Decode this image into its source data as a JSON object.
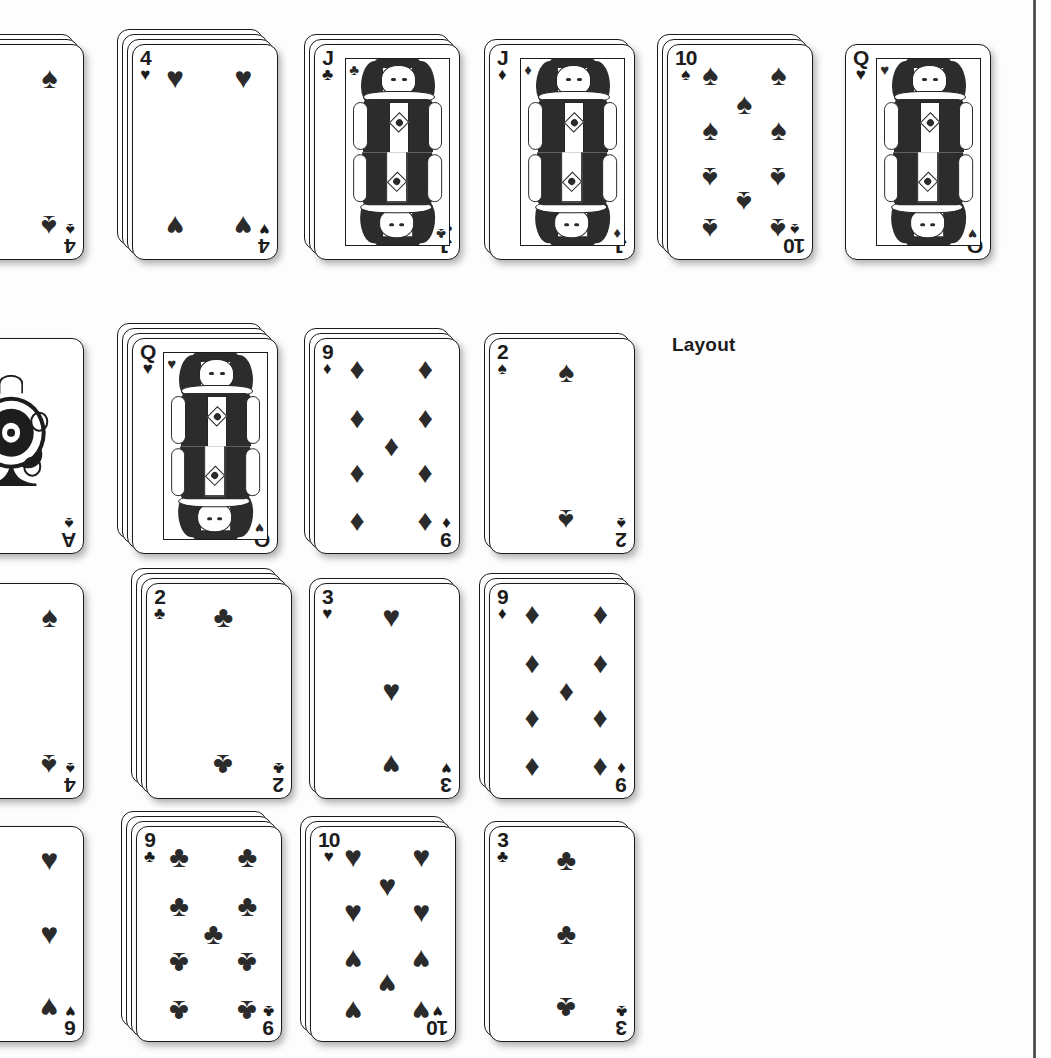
{
  "page": {
    "caption": "Layout",
    "caption_x": 672,
    "caption_y": 334,
    "background": "#fdfdfd",
    "rule_color": "#3a3a3a"
  },
  "suits": {
    "spade": "♠",
    "heart": "♥",
    "diamond": "♦",
    "club": "♣"
  },
  "card_size": {
    "w": 146,
    "h": 216
  },
  "tableau": {
    "rows": [
      {
        "row": 1,
        "y": 44,
        "cards": [
          {
            "rank": "4",
            "suit": "spade",
            "stack": 3,
            "x": -62,
            "art": "pips",
            "clipped": true
          },
          {
            "rank": "4",
            "suit": "heart",
            "stack": 4,
            "x": 132,
            "art": "pips",
            "clipped": false
          },
          {
            "rank": "J",
            "suit": "club",
            "stack": 3,
            "x": 314,
            "art": "court",
            "clipped": false
          },
          {
            "rank": "J",
            "suit": "diamond",
            "stack": 2,
            "x": 489,
            "art": "court",
            "clipped": false
          },
          {
            "rank": "10",
            "suit": "spade",
            "stack": 3,
            "x": 667,
            "art": "pips",
            "clipped": false
          },
          {
            "rank": "Q",
            "suit": "heart",
            "stack": 1,
            "x": 845,
            "art": "court",
            "clipped": false
          }
        ]
      },
      {
        "row": 2,
        "y": 338,
        "cards": [
          {
            "rank": "A",
            "suit": "spade",
            "stack": 1,
            "x": -62,
            "art": "ace",
            "clipped": true
          },
          {
            "rank": "Q",
            "suit": "heart",
            "stack": 4,
            "x": 132,
            "art": "court",
            "clipped": false
          },
          {
            "rank": "9",
            "suit": "diamond",
            "stack": 3,
            "x": 314,
            "art": "pips",
            "clipped": false
          },
          {
            "rank": "2",
            "suit": "spade",
            "stack": 2,
            "x": 489,
            "art": "pips",
            "clipped": false
          }
        ]
      },
      {
        "row": 3,
        "y": 583,
        "cards": [
          {
            "rank": "4",
            "suit": "spade",
            "stack": 1,
            "x": -62,
            "art": "pips",
            "clipped": true
          },
          {
            "rank": "2",
            "suit": "club",
            "stack": 4,
            "x": 146,
            "art": "pips",
            "clipped": false
          },
          {
            "rank": "3",
            "suit": "heart",
            "stack": 2,
            "x": 314,
            "art": "pips",
            "clipped": false
          },
          {
            "rank": "9",
            "suit": "diamond",
            "stack": 3,
            "x": 489,
            "art": "pips",
            "clipped": false
          }
        ]
      },
      {
        "row": 4,
        "y": 826,
        "cards": [
          {
            "rank": "6",
            "suit": "heart",
            "stack": 1,
            "x": -62,
            "art": "pips",
            "clipped": true
          },
          {
            "rank": "9",
            "suit": "club",
            "stack": 4,
            "x": 136,
            "art": "pips",
            "clipped": false
          },
          {
            "rank": "10",
            "suit": "heart",
            "stack": 3,
            "x": 310,
            "art": "pips",
            "clipped": false
          },
          {
            "rank": "3",
            "suit": "club",
            "stack": 2,
            "x": 489,
            "art": "pips",
            "clipped": false
          }
        ]
      }
    ]
  },
  "pip_layouts": {
    "2": [
      [
        50,
        10,
        0
      ],
      [
        50,
        90,
        1
      ]
    ],
    "3": [
      [
        50,
        10,
        0
      ],
      [
        50,
        50,
        0
      ],
      [
        50,
        90,
        1
      ]
    ],
    "4": [
      [
        18,
        10,
        0
      ],
      [
        82,
        10,
        0
      ],
      [
        18,
        90,
        1
      ],
      [
        82,
        90,
        1
      ]
    ],
    "6": [
      [
        18,
        10,
        0
      ],
      [
        82,
        10,
        0
      ],
      [
        18,
        50,
        0
      ],
      [
        82,
        50,
        0
      ],
      [
        18,
        90,
        1
      ],
      [
        82,
        90,
        1
      ]
    ],
    "9": [
      [
        18,
        8,
        0
      ],
      [
        82,
        8,
        0
      ],
      [
        18,
        35,
        0
      ],
      [
        82,
        35,
        0
      ],
      [
        50,
        50,
        0
      ],
      [
        18,
        66,
        1
      ],
      [
        82,
        66,
        1
      ],
      [
        18,
        92,
        1
      ],
      [
        82,
        92,
        1
      ]
    ],
    "10": [
      [
        18,
        8,
        0
      ],
      [
        82,
        8,
        0
      ],
      [
        50,
        24,
        0
      ],
      [
        18,
        38,
        0
      ],
      [
        82,
        38,
        0
      ],
      [
        18,
        64,
        1
      ],
      [
        82,
        64,
        1
      ],
      [
        50,
        77,
        1
      ],
      [
        18,
        92,
        1
      ],
      [
        82,
        92,
        1
      ]
    ]
  }
}
